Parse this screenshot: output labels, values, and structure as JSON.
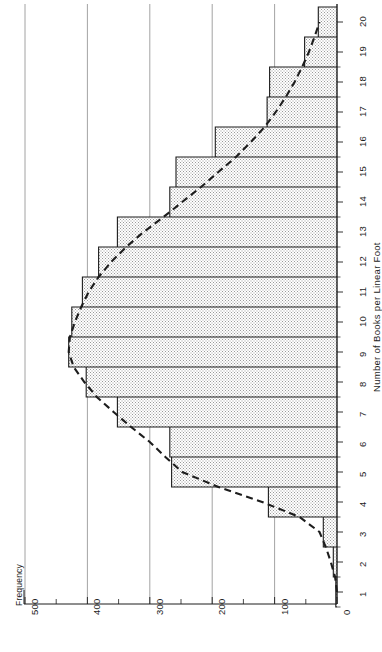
{
  "figure": {
    "orientation": "rotated-90-ccw",
    "background": "#ffffff",
    "ink_color": "#1d1d1d",
    "grid_color": "#8c8c8c",
    "fill_color": "#d6d6d6"
  },
  "labels": {
    "frequency_axis_title": "Frequency",
    "books_axis_title": "Number of Books per Linear Foot"
  },
  "chart_data": {
    "type": "bar",
    "title": "",
    "subtitle": "",
    "xlabel": "Number of Books per Linear Foot",
    "ylabel": "Frequency",
    "orientation": "vertical-histogram-rotated",
    "grid": true,
    "grid_axis": "frequency",
    "legend": false,
    "legend_position": "none",
    "xlim": [
      0.5,
      20.5
    ],
    "ylim": [
      0,
      500
    ],
    "xticks": [
      1,
      2,
      3,
      4,
      5,
      6,
      7,
      8,
      9,
      10,
      11,
      12,
      13,
      14,
      15,
      16,
      17,
      18,
      19,
      20
    ],
    "xtick_labels": [
      "1",
      "2",
      "3",
      "4",
      "5",
      "6",
      "7",
      "8",
      "9",
      "10",
      "11",
      "12",
      "13",
      "14",
      "15",
      "16",
      "17",
      "18",
      "19",
      "20"
    ],
    "yticks": [
      0,
      100,
      200,
      300,
      400,
      500
    ],
    "ytick_labels": [
      "0",
      "100",
      "200",
      "300",
      "400",
      "500"
    ],
    "yticks_minor": [
      50,
      150,
      250,
      350,
      450
    ],
    "categories": [
      1,
      2,
      3,
      4,
      5,
      6,
      7,
      8,
      9,
      10,
      11,
      12,
      13,
      14,
      15,
      16,
      17,
      18,
      19,
      20
    ],
    "values": [
      2,
      6,
      22,
      110,
      265,
      268,
      352,
      402,
      430,
      425,
      408,
      382,
      352,
      268,
      258,
      195,
      112,
      108,
      52,
      30
    ],
    "series": [
      {
        "name": "Histogram frequency",
        "style": "stepped-outline-filled",
        "values": [
          2,
          6,
          22,
          110,
          265,
          268,
          352,
          402,
          430,
          425,
          408,
          382,
          352,
          268,
          258,
          195,
          112,
          108,
          52,
          30
        ]
      },
      {
        "name": "Fitted smooth curve",
        "style": "dashed",
        "x": [
          1,
          1.5,
          2,
          2.5,
          3,
          3.5,
          4,
          4.5,
          5,
          5.5,
          6,
          6.5,
          7,
          7.5,
          8,
          8.5,
          9,
          9.5,
          10,
          10.5,
          11,
          11.5,
          12,
          12.5,
          13,
          13.5,
          14,
          14.5,
          15,
          15.5,
          16,
          16.5,
          17,
          17.5,
          18,
          18.5,
          19,
          19.5,
          20
        ],
        "values": [
          0,
          3,
          10,
          18,
          28,
          60,
          120,
          190,
          248,
          275,
          300,
          330,
          358,
          385,
          405,
          422,
          430,
          428,
          420,
          410,
          398,
          382,
          362,
          338,
          310,
          278,
          248,
          218,
          190,
          162,
          138,
          116,
          98,
          82,
          68,
          56,
          45,
          36,
          28
        ]
      }
    ],
    "annotations": []
  }
}
